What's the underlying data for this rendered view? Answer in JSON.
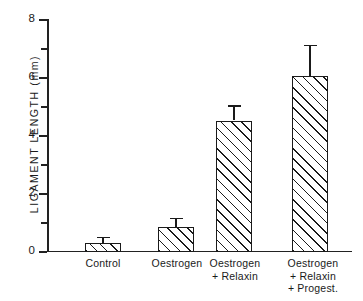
{
  "chart_data": {
    "type": "bar",
    "title": "",
    "xlabel": "",
    "ylabel": "LIGAMENT  LENGTH  (mm)",
    "ylim": [
      0,
      8
    ],
    "ytick_labels": [
      "0",
      "2",
      "4",
      "6",
      "8"
    ],
    "ytick_values": [
      0,
      2,
      4,
      6,
      8
    ],
    "yminor_ticks": [
      1,
      3,
      5,
      7
    ],
    "grid": false,
    "legend": "none",
    "categories": [
      "Control",
      "Oestrogen",
      "Oestrogen\n+ Relaxin",
      "Oestrogen\n+ Relaxin\n+ Progest."
    ],
    "values": [
      0.28,
      0.83,
      4.5,
      6.05
    ],
    "errors": [
      0.22,
      0.32,
      0.52,
      1.05
    ],
    "error_type": "SEM",
    "bar_fill": "diagonal-hatch",
    "bar_color": "#1a1a1a",
    "background": "#ffffff"
  },
  "axis": {
    "y_title": "LIGAMENT  LENGTH  (mm)",
    "ticks": [
      {
        "label": "8",
        "value": 8
      },
      {
        "label": "6",
        "value": 6
      },
      {
        "label": "4",
        "value": 4
      },
      {
        "label": "2",
        "value": 2
      },
      {
        "label": "0",
        "value": 0
      }
    ]
  },
  "labels": {
    "cat0": "Control",
    "cat1": "Oestrogen",
    "cat2": "Oestrogen\n+ Relaxin",
    "cat3": "Oestrogen\n+ Relaxin\n+ Progest."
  }
}
